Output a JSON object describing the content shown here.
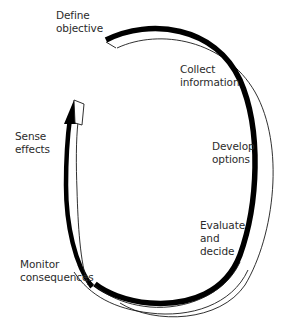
{
  "diagram": {
    "type": "cycle",
    "direction": "clockwise",
    "colors": {
      "ribbon_dark": "#000000",
      "ribbon_outline": "#1a1a1a",
      "text": "#2b2b2b",
      "background": "#ffffff"
    },
    "steps": [
      {
        "id": "define",
        "lines": [
          "Define",
          "objective"
        ]
      },
      {
        "id": "collect",
        "lines": [
          "Collect",
          "information"
        ]
      },
      {
        "id": "develop",
        "lines": [
          "Develop",
          "options"
        ]
      },
      {
        "id": "evaluate",
        "lines": [
          "Evaluate",
          "and",
          "decide"
        ]
      },
      {
        "id": "monitor",
        "lines": [
          "Monitor",
          "consequences"
        ]
      },
      {
        "id": "sense",
        "lines": [
          "Sense",
          "effects"
        ]
      }
    ]
  }
}
